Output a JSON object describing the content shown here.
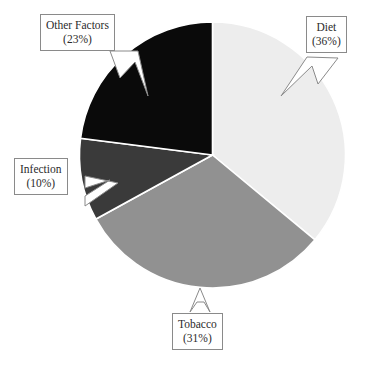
{
  "chart_data": {
    "type": "pie",
    "title": "",
    "subtitle": "",
    "xlabel": "",
    "ylabel": "",
    "legend_position": "none",
    "grid": false,
    "label_format": "name (percent%)",
    "units": "percent",
    "total": 100,
    "categories": [
      "Diet",
      "Tobacco",
      "Infection",
      "Other Factors"
    ],
    "values": [
      36,
      31,
      10,
      23
    ],
    "colors": [
      "#ededed",
      "#919191",
      "#3a3a3a",
      "#0a0a0a"
    ],
    "start_angle_deg": 0,
    "direction": "clockwise",
    "slices": [
      {
        "name": "Diet",
        "percent": 36,
        "label": "Diet",
        "percent_label": "(36%)",
        "color": "#ededed",
        "start_deg": 0,
        "end_deg": 129.6
      },
      {
        "name": "Tobacco",
        "percent": 31,
        "label": "Tobacco",
        "percent_label": "(31%)",
        "color": "#919191",
        "start_deg": 129.6,
        "end_deg": 241.2
      },
      {
        "name": "Infection",
        "percent": 10,
        "label": "Infection",
        "percent_label": "(10%)",
        "color": "#3a3a3a",
        "start_deg": 241.2,
        "end_deg": 277.2
      },
      {
        "name": "Other Factors",
        "percent": 23,
        "label": "Other Factors",
        "percent_label": "(23%)",
        "color": "#0a0a0a",
        "start_deg": 277.2,
        "end_deg": 360
      }
    ]
  },
  "callouts": {
    "other_factors": {
      "name": "Other Factors",
      "percent": "(23%)"
    },
    "diet": {
      "name": "Diet",
      "percent": "(36%)"
    },
    "infection": {
      "name": "Infection",
      "percent": "(10%)"
    },
    "tobacco": {
      "name": "Tobacco",
      "percent": "(31%)"
    }
  },
  "style": {
    "background": "#ffffff",
    "slice_outline": "#ffffff",
    "callout_border": "#8a8a8a",
    "text_color": "#2b2b2b"
  }
}
